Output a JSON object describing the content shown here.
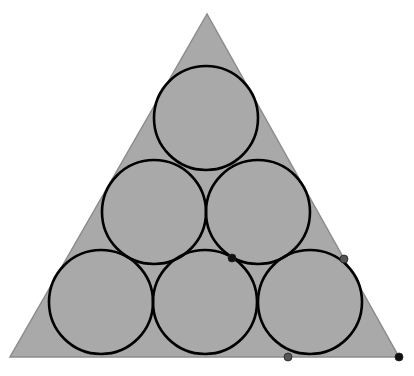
{
  "diagram": {
    "colors": {
      "triangle_fill": "#a9a9a9",
      "triangle_stroke": "#8c8c8c",
      "circle_stroke": "#000000",
      "point_black": "#111111",
      "point_gray": "#555555"
    },
    "triangle": {
      "points": [
        [
          207,
          14
        ],
        [
          10,
          357
        ],
        [
          399,
          357
        ]
      ]
    },
    "circle_radius": 52,
    "circles": [
      {
        "cx": 206,
        "cy": 118
      },
      {
        "cx": 154,
        "cy": 212
      },
      {
        "cx": 258,
        "cy": 212
      },
      {
        "cx": 101,
        "cy": 302
      },
      {
        "cx": 205,
        "cy": 302
      },
      {
        "cx": 310,
        "cy": 302
      }
    ],
    "points": [
      {
        "x": 232,
        "y": 258,
        "style": "black"
      },
      {
        "x": 344,
        "y": 259,
        "style": "gray"
      },
      {
        "x": 288,
        "y": 357,
        "style": "gray"
      },
      {
        "x": 399,
        "y": 357,
        "style": "black"
      }
    ]
  }
}
